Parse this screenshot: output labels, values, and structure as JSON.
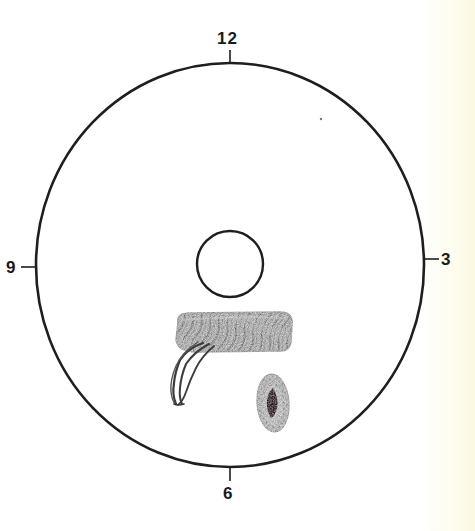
{
  "diagram": {
    "type": "clock-face-position-diagram",
    "outer_circle": {
      "cx": 230,
      "cy": 265,
      "rx": 194,
      "ry": 202,
      "stroke": "#1e1e1e"
    },
    "inner_circle": {
      "cx": 230,
      "cy": 264,
      "r": 33,
      "stroke": "#1e1e1e"
    },
    "clock_labels": {
      "top": "12",
      "right": "3",
      "bottom": "6",
      "left": "9"
    },
    "markings": [
      {
        "name": "shaded-band",
        "description": "horizontal coiled/shaded band below center",
        "color": "#8a8a8a"
      },
      {
        "name": "streak-marks",
        "description": "dark curved streaks extending down-left from band",
        "color": "#3a3a3a"
      },
      {
        "name": "oval-lesion",
        "description": "small shaded oval with dark center, lower right",
        "color": "#9a9a9a",
        "core_color": "#2a1a1e"
      }
    ]
  }
}
